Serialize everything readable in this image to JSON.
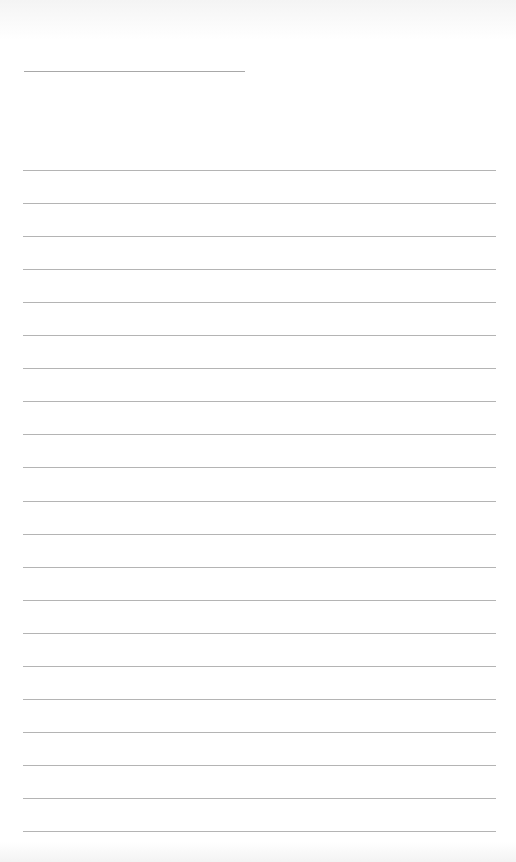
{
  "page": {
    "type": "lined-paper",
    "background_color": "#ffffff",
    "line_color": "#b4b4b4",
    "title_line": {
      "x": 24,
      "y": 71,
      "width": 221
    },
    "ruled_lines": {
      "count": 21,
      "x": 23,
      "width": 473,
      "start_y": 170,
      "spacing": 33.05
    }
  }
}
